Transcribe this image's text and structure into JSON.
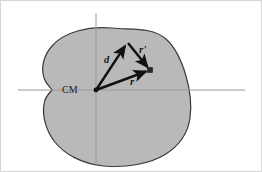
{
  "figure": {
    "background_color": "#ffffff",
    "border_color": "#c9c9c9",
    "body": {
      "name": "rigid-body-blob",
      "fill_color": "#b9b9b9",
      "stroke_color": "#3a3a3a",
      "stroke_width": 1.2
    },
    "axes": {
      "color": "#9a9a9a",
      "stroke_width": 1,
      "horizontal": {
        "x1": 18,
        "y1": 90,
        "x2": 245,
        "y2": 90
      },
      "vertical": {
        "x1": 96,
        "y1": 13,
        "x2": 96,
        "y2": 166
      }
    },
    "origin_label": {
      "name": "center-of-mass-label",
      "text": "CM",
      "x": 62,
      "y": 93
    },
    "vectors": [
      {
        "name": "vector-d",
        "label": "d",
        "from": [
          96,
          90
        ],
        "to": [
          128,
          43
        ],
        "label_x": 104,
        "label_y": 63,
        "color": "#111111",
        "width": 2.4
      },
      {
        "name": "vector-r-prime",
        "label": "r'",
        "from": [
          128,
          43
        ],
        "to": [
          150,
          70
        ],
        "label_x": 139,
        "label_y": 53,
        "color": "#111111",
        "width": 2.4
      },
      {
        "name": "vector-r",
        "label": "r",
        "from": [
          96,
          90
        ],
        "to": [
          150,
          70
        ],
        "label_x": 130,
        "label_y": 85,
        "color": "#111111",
        "width": 2.4
      }
    ],
    "point_marker": {
      "name": "mass-element-point",
      "x": 150,
      "y": 70,
      "size": 5,
      "color": "#2a2a2a"
    }
  }
}
